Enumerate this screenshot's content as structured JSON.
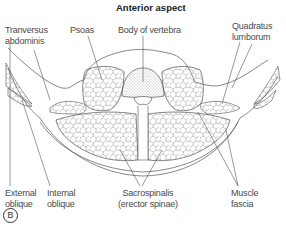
{
  "figure": {
    "title": "Anterior aspect",
    "panel_label": "B",
    "labels": {
      "transversus_abdominis": [
        "Tranversus",
        "abdominis"
      ],
      "psoas": [
        "Psoas"
      ],
      "body_of_vertebra": [
        "Body of vertebra"
      ],
      "quadratus_lumborum": [
        "Quadratus",
        "lumborum"
      ],
      "external_oblique": [
        "External",
        "oblique"
      ],
      "internal_oblique": [
        "Internal",
        "oblique"
      ],
      "sacrospinalis": [
        "Sacrospinalis",
        "(erector spinae)"
      ],
      "muscle_fascia": [
        "Muscle",
        "fascia"
      ]
    },
    "colors": {
      "line": "#555555",
      "text": "#4a4a4a",
      "background": "#ffffff"
    }
  }
}
